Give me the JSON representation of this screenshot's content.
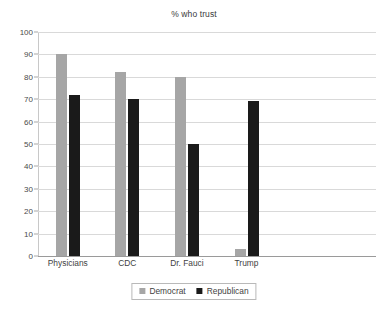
{
  "chart_data": {
    "type": "bar",
    "title": "% who trust",
    "xlabel": "",
    "ylabel": "",
    "ylim": [
      0,
      100
    ],
    "ytick_step": 10,
    "yticks": [
      "0",
      "10",
      "20",
      "30",
      "40",
      "50",
      "60",
      "70",
      "80",
      "90",
      "100"
    ],
    "categories": [
      "Physicians",
      "CDC",
      "Dr. Fauci",
      "Trump"
    ],
    "series": [
      {
        "name": "Democrat",
        "color": "#a6a6a6",
        "values": [
          90,
          82,
          80,
          3
        ]
      },
      {
        "name": "Republican",
        "color": "#1a1a1a",
        "values": [
          72,
          70,
          50,
          69
        ]
      }
    ],
    "grid": true,
    "legend_position": "bottom"
  },
  "legend": {
    "items": [
      {
        "label": "Democrat"
      },
      {
        "label": "Republican"
      }
    ]
  }
}
